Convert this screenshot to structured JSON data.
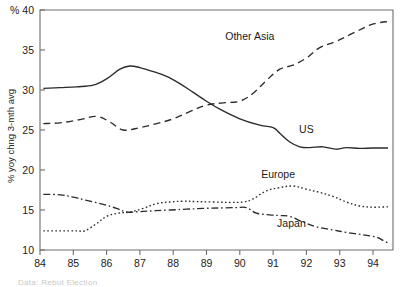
{
  "chart_data": {
    "type": "line",
    "title": "",
    "subtitle": "",
    "xlabel": "",
    "ylabel": "% yoy chng 3-mth avg",
    "corner_label": "% 40",
    "xlim": [
      1984.0,
      1994.6
    ],
    "ylim": [
      10,
      40
    ],
    "grid": false,
    "legend_position": "inline-annotations",
    "x_tick_labels": [
      "84",
      "85",
      "86",
      "87",
      "88",
      "89",
      "90",
      "91",
      "92",
      "93",
      "94"
    ],
    "x_tick_values": [
      1984,
      1985,
      1986,
      1987,
      1988,
      1989,
      1990,
      1991,
      1992,
      1993,
      1994
    ],
    "y_tick_labels": [
      "40",
      "35",
      "30",
      "25",
      "20",
      "15",
      "10"
    ],
    "y_tick_values": [
      40,
      35,
      30,
      25,
      20,
      15,
      10
    ],
    "series": [
      {
        "name": "US",
        "label": "US",
        "style": "solid",
        "label_x": 1992.0,
        "label_y": 24.6,
        "x": [
          1984.1,
          1984.6,
          1985.1,
          1985.6,
          1986.0,
          1986.4,
          1986.7,
          1987.0,
          1987.4,
          1987.8,
          1988.2,
          1988.6,
          1989.0,
          1989.4,
          1990.0,
          1990.6,
          1991.0,
          1991.2,
          1991.5,
          1991.8,
          1992.1,
          1992.5,
          1992.9,
          1993.2,
          1993.6,
          1994.0,
          1994.45
        ],
        "y": [
          30.2,
          30.3,
          30.4,
          30.6,
          31.4,
          32.6,
          33.0,
          32.8,
          32.3,
          31.7,
          30.8,
          29.7,
          28.6,
          27.6,
          26.4,
          25.6,
          25.3,
          24.6,
          23.5,
          22.9,
          22.8,
          22.9,
          22.6,
          22.8,
          22.7,
          22.75,
          22.75
        ]
      },
      {
        "name": "Other Asia",
        "label": "Other Asia",
        "style": "dashed",
        "label_x": 1990.3,
        "label_y": 36.3,
        "x": [
          1984.1,
          1984.6,
          1985.2,
          1985.7,
          1986.1,
          1986.5,
          1987.0,
          1987.5,
          1988.0,
          1988.5,
          1989.0,
          1989.5,
          1990.0,
          1990.4,
          1990.8,
          1991.2,
          1991.6,
          1992.0,
          1992.4,
          1992.9,
          1993.4,
          1993.9,
          1994.3,
          1994.45
        ],
        "y": [
          25.8,
          25.9,
          26.3,
          26.7,
          26.0,
          25.0,
          25.3,
          25.8,
          26.4,
          27.3,
          28.1,
          28.4,
          28.6,
          29.6,
          31.2,
          32.6,
          33.1,
          34.0,
          35.3,
          36.1,
          37.1,
          38.1,
          38.5,
          38.5
        ]
      },
      {
        "name": "Europe",
        "label": "Europe",
        "style": "dotted",
        "label_x": 1991.15,
        "label_y": 19.0,
        "x": [
          1984.1,
          1984.6,
          1985.1,
          1985.35,
          1985.7,
          1986.0,
          1986.35,
          1986.7,
          1987.1,
          1987.5,
          1987.9,
          1988.3,
          1988.7,
          1989.2,
          1989.7,
          1990.1,
          1990.4,
          1990.8,
          1991.2,
          1991.6,
          1992.0,
          1992.4,
          1992.8,
          1993.2,
          1993.6,
          1994.0,
          1994.45
        ],
        "y": [
          12.4,
          12.4,
          12.4,
          12.4,
          13.3,
          14.2,
          14.6,
          14.75,
          15.2,
          15.8,
          16.0,
          16.1,
          16.05,
          16.0,
          15.95,
          16.0,
          16.4,
          17.4,
          17.8,
          18.0,
          17.6,
          17.2,
          16.7,
          16.0,
          15.5,
          15.35,
          15.4
        ]
      },
      {
        "name": "Japan",
        "label": "Japan",
        "style": "dashdot",
        "label_x": 1991.55,
        "label_y": 12.9,
        "x": [
          1984.1,
          1984.6,
          1985.0,
          1985.4,
          1985.9,
          1986.3,
          1986.6,
          1987.0,
          1987.4,
          1987.9,
          1988.4,
          1988.9,
          1989.4,
          1989.9,
          1990.2,
          1990.5,
          1990.9,
          1991.2,
          1991.5,
          1991.9,
          1992.3,
          1992.8,
          1993.2,
          1993.7,
          1994.1,
          1994.3,
          1994.45
        ],
        "y": [
          16.95,
          16.9,
          16.6,
          16.2,
          15.7,
          15.2,
          14.75,
          14.8,
          14.9,
          15.0,
          15.1,
          15.2,
          15.25,
          15.3,
          15.3,
          14.6,
          14.4,
          14.3,
          14.2,
          13.5,
          12.9,
          12.5,
          12.2,
          11.9,
          11.6,
          11.2,
          10.9
        ]
      }
    ]
  },
  "footer": {
    "note": "Data: Rebut Election"
  }
}
